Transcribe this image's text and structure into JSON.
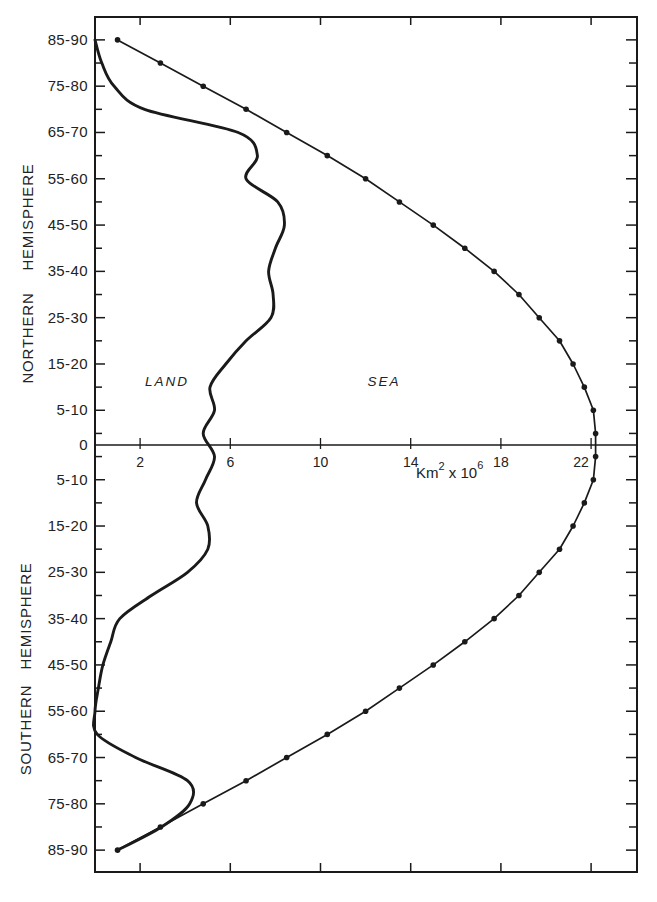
{
  "figure": {
    "hemisphere_labels": {
      "north": {
        "word1": "NORTHERN",
        "word2": "HEMISPHERE"
      },
      "south": {
        "word1": "SOUTHERN",
        "word2": "HEMISPHERE"
      }
    },
    "region_labels": {
      "land": "LAND",
      "sea": "SEA"
    },
    "x_axis_label": {
      "base": "Km",
      "exp1": "2",
      "mid": " x 10",
      "exp2": "6"
    },
    "equator_label": "0",
    "y_tick_labels_north": [
      "85-90",
      "75-80",
      "65-70",
      "55-60",
      "45-50",
      "35-40",
      "25-30",
      "15-20",
      "5-10"
    ],
    "y_tick_labels_south": [
      "5-10",
      "15-20",
      "25-30",
      "35-40",
      "45-50",
      "55-60",
      "65-70",
      "75-80",
      "85-90"
    ],
    "x_tick_labels": [
      "2",
      "6",
      "10",
      "14",
      "18",
      "22"
    ],
    "colors": {
      "ink": "#1a1a1a",
      "background": "#ffffff"
    }
  },
  "chart_data": {
    "type": "line",
    "title": "",
    "xlabel": "Km² x 10⁶",
    "ylabel": "Latitude band (NORTHERN HEMISPHERE / SOUTHERN HEMISPHERE)",
    "xlim": [
      0,
      24
    ],
    "x_ticks": [
      2,
      6,
      10,
      14,
      18,
      22
    ],
    "y_tick_labels": [
      "85-90",
      "75-80",
      "65-70",
      "55-60",
      "45-50",
      "35-40",
      "25-30",
      "15-20",
      "5-10",
      "0",
      "5-10",
      "15-20",
      "25-30",
      "35-40",
      "45-50",
      "55-60",
      "65-70",
      "75-80",
      "85-90"
    ],
    "categories": [
      "85-90 N",
      "80-85 N",
      "75-80 N",
      "70-75 N",
      "65-70 N",
      "60-65 N",
      "55-60 N",
      "50-55 N",
      "45-50 N",
      "40-45 N",
      "35-40 N",
      "30-35 N",
      "25-30 N",
      "20-25 N",
      "15-20 N",
      "10-15 N",
      "5-10 N",
      "0-5 N",
      "0-5 S",
      "5-10 S",
      "10-15 S",
      "15-20 S",
      "20-25 S",
      "25-30 S",
      "30-35 S",
      "35-40 S",
      "40-45 S",
      "45-50 S",
      "50-55 S",
      "55-60 S",
      "60-65 S",
      "65-70 S",
      "70-75 S",
      "75-80 S",
      "80-85 S",
      "85-90 S"
    ],
    "lat_centers": [
      87.5,
      82.5,
      77.5,
      72.5,
      67.5,
      62.5,
      57.5,
      52.5,
      47.5,
      42.5,
      37.5,
      32.5,
      27.5,
      22.5,
      17.5,
      12.5,
      7.5,
      2.5,
      -2.5,
      -7.5,
      -12.5,
      -17.5,
      -22.5,
      -27.5,
      -32.5,
      -37.5,
      -42.5,
      -47.5,
      -52.5,
      -57.5,
      -62.5,
      -67.5,
      -72.5,
      -77.5,
      -82.5,
      -87.5
    ],
    "series": [
      {
        "name": "Total area (land + sea)",
        "marker": "dot",
        "values": [
          1.0,
          2.9,
          4.8,
          6.7,
          8.5,
          10.3,
          12.0,
          13.5,
          15.0,
          16.4,
          17.7,
          18.8,
          19.7,
          20.6,
          21.2,
          21.7,
          22.1,
          22.2,
          22.2,
          22.1,
          21.7,
          21.2,
          20.6,
          19.7,
          18.8,
          17.7,
          16.4,
          15.0,
          13.5,
          12.0,
          10.3,
          8.5,
          6.7,
          4.8,
          2.9,
          1.0
        ]
      },
      {
        "name": "Land",
        "marker": "none",
        "values": [
          0.0,
          0.3,
          0.85,
          2.2,
          6.35,
          7.2,
          6.7,
          8.1,
          8.4,
          8.0,
          7.7,
          7.9,
          7.8,
          6.7,
          5.8,
          5.1,
          5.3,
          4.8,
          5.3,
          4.9,
          4.5,
          5.0,
          5.0,
          4.1,
          2.5,
          1.1,
          0.7,
          0.35,
          0.15,
          0.0,
          0.1,
          1.8,
          4.1,
          4.2,
          2.95,
          1.0
        ]
      }
    ],
    "annotations": [
      {
        "text": "LAND",
        "x": 3.2,
        "lat": 14
      },
      {
        "text": "SEA",
        "x": 12.8,
        "lat": 14
      }
    ],
    "grid": false,
    "legend": "none"
  }
}
